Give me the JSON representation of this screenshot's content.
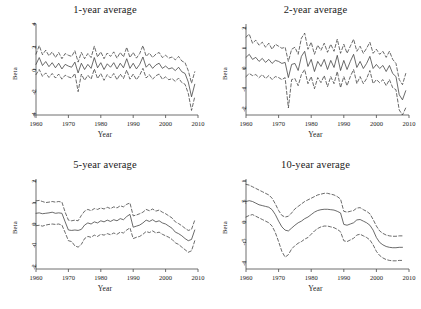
{
  "figure": {
    "axis_label_x": "Year",
    "axis_label_y": "Beta",
    "line_color": "#3a3a3a",
    "axis_color": "#4a4a4a",
    "background": "#ffffff"
  },
  "chart_data": [
    {
      "type": "line",
      "title": "1-year average",
      "xlabel": "Year",
      "ylabel": "Beta",
      "xlim": [
        1960,
        2010
      ],
      "ylim": [
        -4,
        4
      ],
      "xticks": [
        1960,
        1970,
        1980,
        1990,
        2000,
        2010
      ],
      "yticks": [
        4,
        2,
        0,
        -2,
        -4
      ],
      "ytick_labels": [
        "4",
        "2",
        "0",
        "-2",
        "-4"
      ],
      "grid": false,
      "legend": "none",
      "x": [
        1960,
        1961,
        1962,
        1963,
        1964,
        1965,
        1966,
        1967,
        1968,
        1969,
        1970,
        1971,
        1972,
        1973,
        1974,
        1975,
        1976,
        1977,
        1978,
        1979,
        1980,
        1981,
        1982,
        1983,
        1984,
        1985,
        1986,
        1987,
        1988,
        1989,
        1990,
        1991,
        1992,
        1993,
        1994,
        1995,
        1996,
        1997,
        1998,
        1999,
        2000,
        2001,
        2002,
        2003,
        2004,
        2005,
        2006,
        2007,
        2008,
        2009
      ],
      "series": [
        {
          "name": "estimate",
          "style": "solid",
          "values": [
            0.45,
            1.05,
            0.35,
            0.7,
            0.25,
            0.6,
            0.15,
            0.55,
            0.05,
            0.45,
            0.3,
            0.2,
            0.65,
            -0.3,
            0.55,
            0.0,
            0.45,
            0.1,
            1.05,
            0.15,
            0.6,
            0.0,
            0.5,
            0.2,
            0.6,
            0.05,
            0.55,
            0.15,
            0.95,
            0.1,
            0.55,
            0.05,
            0.45,
            1.1,
            0.2,
            0.5,
            0.1,
            0.4,
            0.55,
            0.1,
            0.3,
            0.05,
            0.15,
            -0.1,
            0.2,
            -0.2,
            -0.35,
            -1.1,
            -2.4,
            -1.3
          ]
        },
        {
          "name": "upper-ci",
          "style": "dashed",
          "values": [
            1.35,
            2.1,
            1.3,
            1.7,
            1.2,
            1.55,
            1.05,
            1.5,
            0.95,
            1.4,
            1.25,
            1.15,
            1.65,
            0.65,
            1.5,
            0.95,
            1.4,
            1.05,
            2.05,
            1.1,
            1.55,
            0.95,
            1.45,
            1.15,
            1.55,
            1.0,
            1.5,
            1.1,
            1.95,
            1.05,
            1.5,
            1.0,
            1.4,
            2.1,
            1.15,
            1.45,
            1.05,
            1.35,
            1.5,
            1.05,
            1.25,
            1.0,
            1.1,
            0.85,
            1.15,
            0.75,
            0.6,
            -0.1,
            -1.2,
            -0.2
          ]
        },
        {
          "name": "lower-ci",
          "style": "dashed",
          "values": [
            -0.45,
            0.0,
            -0.6,
            -0.3,
            -0.7,
            -0.35,
            -0.75,
            -0.4,
            -0.85,
            -0.5,
            -0.65,
            -0.75,
            -0.35,
            -1.95,
            -0.4,
            -0.95,
            -0.5,
            -0.85,
            0.05,
            -0.8,
            -0.35,
            -0.95,
            -0.45,
            -0.75,
            -0.35,
            -0.9,
            -0.4,
            -0.8,
            -0.05,
            -0.85,
            -0.4,
            -0.9,
            -0.5,
            0.1,
            -0.75,
            -0.45,
            -0.85,
            -0.55,
            -0.4,
            -0.85,
            -0.65,
            -0.9,
            -0.8,
            -1.05,
            -0.75,
            -1.15,
            -1.3,
            -2.1,
            -3.6,
            -2.4
          ]
        }
      ]
    },
    {
      "type": "line",
      "title": "2-year average",
      "xlabel": "Year",
      "ylabel": "Beta",
      "xlim": [
        1960,
        2010
      ],
      "ylim": [
        -2.3,
        2.2
      ],
      "xticks": [
        1960,
        1970,
        1980,
        1990,
        2000,
        2010
      ],
      "yticks": [
        2,
        1,
        0,
        -1,
        -2
      ],
      "ytick_labels": [
        "2",
        "1",
        "0",
        "-1",
        "-2"
      ],
      "grid": false,
      "legend": "none",
      "x": [
        1960,
        1961,
        1962,
        1963,
        1964,
        1965,
        1966,
        1967,
        1968,
        1969,
        1970,
        1971,
        1972,
        1973,
        1974,
        1975,
        1976,
        1977,
        1978,
        1979,
        1980,
        1981,
        1982,
        1983,
        1984,
        1985,
        1986,
        1987,
        1988,
        1989,
        1990,
        1991,
        1992,
        1993,
        1994,
        1995,
        1996,
        1997,
        1998,
        1999,
        2000,
        2001,
        2002,
        2003,
        2004,
        2005,
        2006,
        2007,
        2008,
        2009
      ],
      "series": [
        {
          "name": "estimate",
          "style": "solid",
          "values": [
            0.55,
            0.7,
            0.45,
            0.55,
            0.35,
            0.5,
            0.3,
            0.45,
            0.25,
            0.4,
            0.35,
            0.25,
            0.3,
            -0.45,
            0.2,
            0.25,
            -0.1,
            0.6,
            0.85,
            0.1,
            0.45,
            -0.15,
            0.35,
            0.1,
            0.45,
            -0.05,
            0.4,
            0.05,
            0.65,
            -0.1,
            0.4,
            -0.05,
            0.35,
            0.7,
            0.05,
            0.35,
            0.0,
            0.25,
            0.6,
            0.0,
            0.2,
            0.0,
            0.15,
            -0.15,
            0.15,
            -0.25,
            -0.4,
            -1.3,
            -1.55,
            -1.1
          ]
        },
        {
          "name": "upper-ci",
          "style": "dashed",
          "values": [
            1.55,
            1.7,
            1.25,
            1.4,
            1.15,
            1.3,
            1.05,
            1.25,
            0.95,
            1.2,
            1.1,
            1.0,
            1.05,
            0.35,
            0.95,
            1.05,
            0.7,
            1.5,
            1.75,
            0.95,
            1.3,
            0.7,
            1.15,
            0.9,
            1.25,
            0.8,
            1.2,
            0.85,
            1.45,
            0.75,
            1.2,
            0.75,
            1.1,
            1.45,
            0.85,
            1.1,
            0.75,
            1.0,
            1.3,
            0.75,
            0.95,
            0.7,
            0.85,
            0.55,
            0.85,
            0.45,
            0.25,
            -0.55,
            -0.8,
            -0.25
          ]
        },
        {
          "name": "lower-ci",
          "style": "dashed",
          "values": [
            -0.4,
            -0.25,
            -0.35,
            -0.3,
            -0.45,
            -0.3,
            -0.5,
            -0.35,
            -0.55,
            -0.4,
            -0.45,
            -0.55,
            -0.45,
            -1.95,
            -0.55,
            -0.5,
            -0.85,
            -0.3,
            -0.05,
            -0.75,
            -0.4,
            -1.0,
            -0.45,
            -0.7,
            -0.35,
            -0.9,
            -0.4,
            -0.75,
            -0.15,
            -0.95,
            -0.4,
            -0.85,
            -0.4,
            -0.05,
            -0.75,
            -0.4,
            -0.75,
            -0.5,
            -0.1,
            -0.75,
            -0.55,
            -0.7,
            -0.55,
            -0.85,
            -0.55,
            -0.95,
            -1.05,
            -2.05,
            -2.3,
            -1.95
          ]
        }
      ]
    },
    {
      "type": "line",
      "title": "5-year average",
      "xlabel": "Year",
      "ylabel": "Beta",
      "xlim": [
        1960,
        2010
      ],
      "ylim": [
        -2.1,
        2.1
      ],
      "xticks": [
        1960,
        1970,
        1980,
        1990,
        2000,
        2010
      ],
      "yticks": [
        2,
        1,
        0,
        -1,
        -2
      ],
      "ytick_labels": [
        "2",
        "1",
        "0",
        "-1",
        "-2"
      ],
      "grid": false,
      "legend": "none",
      "x": [
        1960,
        1961,
        1962,
        1963,
        1964,
        1965,
        1966,
        1967,
        1968,
        1969,
        1970,
        1971,
        1972,
        1973,
        1974,
        1975,
        1976,
        1977,
        1978,
        1979,
        1980,
        1981,
        1982,
        1983,
        1984,
        1985,
        1986,
        1987,
        1988,
        1989,
        1990,
        1991,
        1992,
        1993,
        1994,
        1995,
        1996,
        1997,
        1998,
        1999,
        2000,
        2001,
        2002,
        2003,
        2004,
        2005,
        2006,
        2007,
        2008,
        2009
      ],
      "series": [
        {
          "name": "estimate",
          "style": "solid",
          "values": [
            0.5,
            0.52,
            0.48,
            0.5,
            0.52,
            0.55,
            0.5,
            0.52,
            0.5,
            0.1,
            -0.28,
            -0.3,
            -0.28,
            -0.3,
            -0.25,
            -0.05,
            0.05,
            0.0,
            0.1,
            0.05,
            0.15,
            0.1,
            0.18,
            0.12,
            0.2,
            0.15,
            0.25,
            0.2,
            0.35,
            0.45,
            -0.15,
            -0.1,
            -0.05,
            0.05,
            0.18,
            0.12,
            0.2,
            0.1,
            0.15,
            0.05,
            0.0,
            -0.1,
            -0.2,
            -0.38,
            -0.45,
            -0.55,
            -0.68,
            -0.78,
            -0.72,
            -0.28
          ]
        },
        {
          "name": "upper-ci",
          "style": "dashed",
          "values": [
            1.08,
            1.1,
            1.05,
            1.0,
            1.02,
            1.05,
            1.02,
            1.05,
            1.02,
            0.55,
            0.18,
            0.15,
            0.18,
            0.15,
            0.4,
            0.6,
            0.68,
            0.62,
            0.72,
            0.68,
            0.75,
            0.7,
            0.78,
            0.72,
            0.8,
            0.75,
            0.85,
            0.8,
            0.92,
            0.98,
            0.38,
            0.42,
            0.48,
            0.55,
            0.68,
            0.62,
            0.7,
            0.6,
            0.65,
            0.55,
            0.48,
            0.38,
            0.28,
            0.1,
            0.02,
            -0.08,
            -0.2,
            -0.3,
            -0.25,
            0.18
          ]
        },
        {
          "name": "lower-ci",
          "style": "dashed",
          "values": [
            -0.08,
            -0.06,
            -0.1,
            -0.05,
            -0.02,
            0.0,
            -0.02,
            0.0,
            -0.05,
            -0.4,
            -0.78,
            -0.82,
            -1.02,
            -1.08,
            -0.95,
            -0.68,
            -0.58,
            -0.62,
            -0.52,
            -0.58,
            -0.48,
            -0.52,
            -0.45,
            -0.5,
            -0.42,
            -0.48,
            -0.38,
            -0.42,
            -0.28,
            -0.18,
            -0.68,
            -0.62,
            -0.58,
            -0.48,
            -0.35,
            -0.4,
            -0.32,
            -0.42,
            -0.38,
            -0.48,
            -0.55,
            -0.62,
            -0.72,
            -0.88,
            -0.95,
            -1.08,
            -1.2,
            -1.32,
            -1.25,
            -0.78
          ]
        }
      ]
    },
    {
      "type": "line",
      "title": "10-year average",
      "xlabel": "Year",
      "ylabel": "Beta",
      "xlim": [
        1960,
        2010
      ],
      "ylim": [
        -1.15,
        1.05
      ],
      "xticks": [
        1960,
        1970,
        1980,
        1990,
        2000,
        2010
      ],
      "yticks": [
        1,
        0.5,
        0,
        -0.5,
        -1
      ],
      "ytick_labels": [
        "1",
        ".5",
        "0",
        "-.5",
        "-1"
      ],
      "grid": false,
      "legend": "none",
      "x": [
        1960,
        1961,
        1962,
        1963,
        1964,
        1965,
        1966,
        1967,
        1968,
        1969,
        1970,
        1971,
        1972,
        1973,
        1974,
        1975,
        1976,
        1977,
        1978,
        1979,
        1980,
        1981,
        1982,
        1983,
        1984,
        1985,
        1986,
        1987,
        1988,
        1989,
        1990,
        1991,
        1992,
        1993,
        1994,
        1995,
        1996,
        1997,
        1998,
        1999,
        2000,
        2001,
        2002,
        2003,
        2004,
        2005,
        2006,
        2007,
        2008
      ],
      "series": [
        {
          "name": "estimate",
          "style": "solid",
          "values": [
            0.5,
            0.52,
            0.5,
            0.46,
            0.42,
            0.4,
            0.38,
            0.36,
            0.3,
            0.18,
            0.02,
            -0.12,
            -0.2,
            -0.22,
            -0.15,
            -0.08,
            -0.02,
            0.02,
            0.08,
            0.12,
            0.18,
            0.24,
            0.28,
            0.3,
            0.31,
            0.31,
            0.3,
            0.29,
            0.26,
            0.22,
            -0.06,
            -0.08,
            -0.05,
            -0.02,
            0.05,
            0.06,
            0.02,
            -0.02,
            -0.08,
            -0.2,
            -0.38,
            -0.5,
            -0.56,
            -0.6,
            -0.62,
            -0.63,
            -0.63,
            -0.62,
            -0.62
          ]
        },
        {
          "name": "upper-ci",
          "style": "dashed",
          "values": [
            0.92,
            0.9,
            0.86,
            0.82,
            0.78,
            0.74,
            0.7,
            0.66,
            0.58,
            0.44,
            0.28,
            0.16,
            0.12,
            0.14,
            0.22,
            0.32,
            0.38,
            0.44,
            0.5,
            0.54,
            0.58,
            0.62,
            0.66,
            0.68,
            0.7,
            0.7,
            0.68,
            0.66,
            0.62,
            0.56,
            0.26,
            0.24,
            0.26,
            0.28,
            0.34,
            0.35,
            0.3,
            0.26,
            0.2,
            0.06,
            -0.1,
            -0.22,
            -0.28,
            -0.32,
            -0.34,
            -0.35,
            -0.35,
            -0.34,
            -0.34
          ]
        },
        {
          "name": "lower-ci",
          "style": "dashed",
          "values": [
            0.12,
            0.16,
            0.18,
            0.14,
            0.1,
            0.06,
            0.02,
            -0.02,
            -0.1,
            -0.26,
            -0.48,
            -0.72,
            -0.86,
            -0.8,
            -0.66,
            -0.58,
            -0.52,
            -0.48,
            -0.42,
            -0.38,
            -0.3,
            -0.22,
            -0.16,
            -0.12,
            -0.1,
            -0.1,
            -0.12,
            -0.14,
            -0.18,
            -0.24,
            -0.46,
            -0.48,
            -0.44,
            -0.4,
            -0.32,
            -0.3,
            -0.34,
            -0.38,
            -0.44,
            -0.56,
            -0.72,
            -0.82,
            -0.88,
            -0.92,
            -0.94,
            -0.95,
            -0.95,
            -0.94,
            -0.94
          ]
        }
      ]
    }
  ]
}
